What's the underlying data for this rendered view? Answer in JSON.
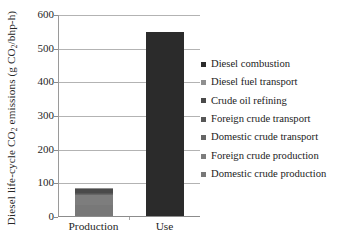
{
  "chart_data": {
    "type": "bar",
    "subtype": "stacked-column",
    "title": "",
    "xlabel": "",
    "ylabel": "Diesel life-cycle CO2 emissions (g CO2/bhp-h)",
    "ylabel_parts": {
      "pre": "Diesel life-cycle CO",
      "sub1": "2",
      "mid": " emissions (g CO",
      "sub2": "2",
      "post": "/bhp-h)"
    },
    "categories": [
      "Production",
      "Use"
    ],
    "ylim": [
      0,
      600
    ],
    "yticks": [
      0,
      100,
      200,
      300,
      400,
      500,
      600
    ],
    "ytick_labels": [
      "0",
      "100",
      "200",
      "300",
      "400",
      "500",
      "600"
    ],
    "grid": true,
    "grid_axis": "y",
    "legend_position": "right",
    "series": [
      {
        "name": "Diesel combustion",
        "color": "#2b2b2b",
        "values": [
          0,
          548
        ]
      },
      {
        "name": "Diesel fuel transport",
        "color": "#8f8f8f",
        "values": [
          2,
          0
        ]
      },
      {
        "name": "Crude oil refining",
        "color": "#4a4a4a",
        "values": [
          13,
          0
        ]
      },
      {
        "name": "Foreign crude transport",
        "color": "#575757",
        "values": [
          2,
          0
        ]
      },
      {
        "name": "Domestic crude transport",
        "color": "#666666",
        "values": [
          1,
          0
        ]
      },
      {
        "name": "Foreign crude production",
        "color": "#7d7d7d",
        "values": [
          33,
          0
        ]
      },
      {
        "name": "Domestic crude production",
        "color": "#787878",
        "values": [
          32,
          0
        ]
      }
    ],
    "totals": [
      83,
      548
    ],
    "colors": {
      "gridline": "#b3b3b3",
      "axis": "#8c8c8c",
      "text": "#1f1f1f",
      "background": "#ffffff"
    }
  },
  "legend": {
    "items": [
      {
        "label": "Diesel combustion"
      },
      {
        "label": "Diesel fuel transport"
      },
      {
        "label": "Crude oil refining"
      },
      {
        "label": "Foreign crude transport"
      },
      {
        "label": "Domestic crude transport"
      },
      {
        "label": "Foreign crude production"
      },
      {
        "label": "Domestic crude production"
      }
    ]
  }
}
